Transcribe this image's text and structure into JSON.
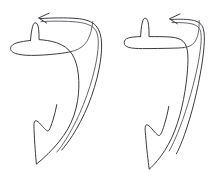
{
  "canvas": {
    "width": 215,
    "height": 188,
    "background_color": "#ffffff",
    "ink_color": "#3b3b40",
    "ink_color_soft": "#55555c",
    "style": "hand-drawn line art, no fill, thin outline"
  },
  "figures": [
    {
      "id": "figure-left",
      "label": "left-hook-shape",
      "description": "rounded hand-drawn hook / fin outline with small ear bump at upper left and pointed tail at lower left",
      "parts": {
        "ear_bump": "small rounded spike on top-left of head",
        "head": "rounded lobe at upper left",
        "body": "long curved band sweeping right then down-left",
        "tail_tip": "sharp downward point at bottom",
        "notch": "concave notch on left side above the tail"
      }
    },
    {
      "id": "figure-right",
      "label": "right-hook-shape",
      "description": "angular hand-drawn hook / fin outline with small ear bump at upper left and pointed tail at lower left",
      "parts": {
        "ear_bump": "small narrow spike on top-left of head",
        "head": "squared lobe at upper left",
        "body": "long band bending at a sharp right-angle corner then down",
        "tail_tip": "sharp downward point at bottom",
        "notch": "concave notch on left side above the tail"
      }
    }
  ],
  "arrows": [
    {
      "id": "arrow-left",
      "label": "motion-arrow-left",
      "direction": "leftward",
      "head_position": {
        "x": 39,
        "y": 17
      },
      "description": "curved arrow sweeping from lower right up and over to the left, arrowhead pointing left"
    },
    {
      "id": "arrow-right",
      "label": "motion-arrow-right",
      "direction": "leftward",
      "head_position": {
        "x": 170,
        "y": 18
      },
      "description": "curved arrow sweeping from lower right up and over to the left, arrowhead pointing left"
    }
  ],
  "annotations": {
    "text_items": [],
    "caption": ""
  }
}
